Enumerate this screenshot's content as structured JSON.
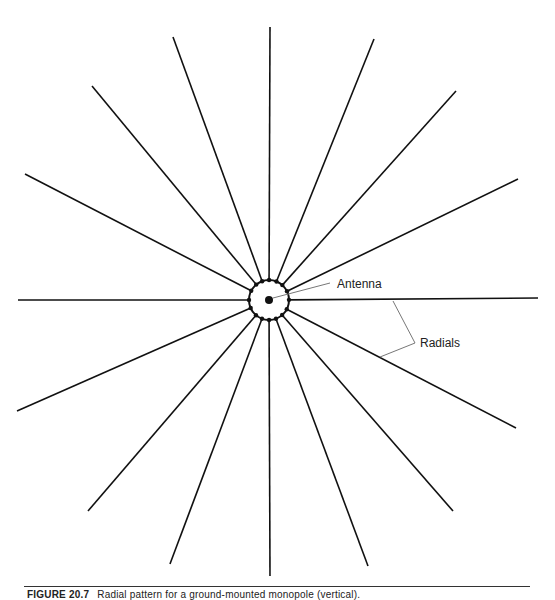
{
  "diagram": {
    "title": "Radial pattern for a ground-mounted monopole (vertical)",
    "center": [
      269,
      300
    ],
    "ring_radius": 20,
    "antenna_dot_radius": 4,
    "line_color": "#111111",
    "callout_color": "#777777",
    "radials": [
      {
        "end": [
          270,
          27
        ]
      },
      {
        "end": [
          374,
          39
        ]
      },
      {
        "end": [
          456,
          91
        ]
      },
      {
        "end": [
          518,
          179
        ]
      },
      {
        "end": [
          538,
          298
        ]
      },
      {
        "end": [
          516,
          428
        ]
      },
      {
        "end": [
          453,
          511
        ]
      },
      {
        "end": [
          368,
          566
        ]
      },
      {
        "end": [
          270,
          576
        ]
      },
      {
        "end": [
          170,
          564
        ]
      },
      {
        "end": [
          88,
          511
        ]
      },
      {
        "end": [
          17,
          411
        ]
      },
      {
        "end": [
          18,
          300
        ]
      },
      {
        "end": [
          25,
          174
        ]
      },
      {
        "end": [
          92,
          86
        ]
      },
      {
        "end": [
          173,
          37
        ]
      }
    ],
    "labels": {
      "antenna": "Antenna",
      "radials": "Radials"
    }
  },
  "caption": {
    "figure_number": "FIGURE 20.7",
    "text": "Radial pattern for a ground-mounted monopole (vertical)."
  }
}
